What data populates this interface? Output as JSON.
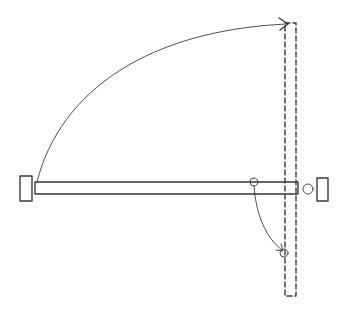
{
  "diagram": {
    "type": "door-swing-plan",
    "colors": {
      "ink": "#3a3a3a",
      "background": "#ffffff"
    },
    "elements": {
      "left_post": {
        "x": 20,
        "y": 176,
        "w": 12,
        "h": 25
      },
      "right_post": {
        "x": 317,
        "y": 178,
        "w": 11,
        "h": 23
      },
      "bar_closed": {
        "x": 35,
        "y": 182,
        "w": 263,
        "h": 12
      },
      "bar_open_dashed": {
        "x": 285,
        "y": 23,
        "w": 11,
        "h": 273
      },
      "latch_circle": {
        "cx": 308,
        "cy": 189,
        "r": 5
      },
      "pivot_circle_start": {
        "cx": 254,
        "cy": 182,
        "r": 4
      },
      "pivot_circle_end": {
        "cx": 284,
        "cy": 253,
        "r": 4
      },
      "swing_arc": {
        "from": [
          37,
          182
        ],
        "to": [
          287,
          24
        ]
      },
      "pivot_arc": {
        "from": [
          254,
          186
        ],
        "to": [
          283,
          250
        ]
      }
    }
  }
}
